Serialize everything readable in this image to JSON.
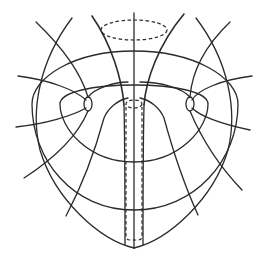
{
  "figure": {
    "colors": {
      "line": "#2b2b2b",
      "background": "#ffffff"
    },
    "elements": {
      "axis": "central vertical axis",
      "top_ellipse": "dashed ellipse at top of hourglass",
      "tube": "dashed cylinder along axis",
      "foci": [
        "left focal loop",
        "right focal loop"
      ],
      "rings": [
        "inner closed curve",
        "outer closed curve"
      ],
      "radial_lines": 12
    }
  }
}
